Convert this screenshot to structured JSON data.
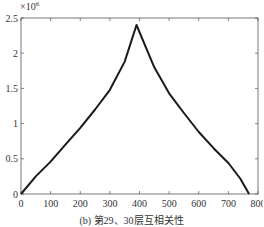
{
  "chart_data": {
    "type": "line",
    "title": "",
    "caption": "(b) 第29、30层互相关性",
    "xlabel": "",
    "ylabel": "",
    "y_multiplier_label": "×10",
    "y_multiplier_exp": "6",
    "xlim": [
      0,
      800
    ],
    "ylim": [
      0,
      2.5
    ],
    "x_ticks": [
      0,
      100,
      200,
      300,
      400,
      500,
      600,
      700,
      800
    ],
    "y_ticks": [
      0,
      0.5,
      1,
      1.5,
      2,
      2.5
    ],
    "x_tick_labels": [
      "0",
      "100",
      "200",
      "300",
      "400",
      "500",
      "600",
      "700",
      "800"
    ],
    "y_tick_labels": [
      "0",
      "0.5",
      "1",
      "1.5",
      "2",
      "2.5"
    ],
    "grid": false,
    "legend": null,
    "series": [
      {
        "name": "cross-correlation",
        "color": "#1a1a1a",
        "x": [
          0,
          50,
          100,
          150,
          200,
          250,
          300,
          350,
          390,
          450,
          500,
          550,
          600,
          650,
          700,
          740,
          770
        ],
        "y": [
          0,
          0.25,
          0.46,
          0.7,
          0.94,
          1.2,
          1.48,
          1.88,
          2.4,
          1.8,
          1.43,
          1.15,
          0.88,
          0.65,
          0.44,
          0.22,
          0
        ]
      }
    ]
  }
}
